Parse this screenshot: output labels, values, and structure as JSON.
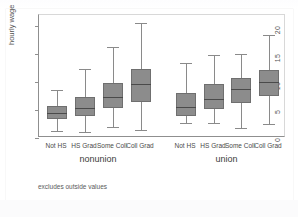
{
  "figure": {
    "footnote": "excludes outside values",
    "box_fill_color": "#8c8c8c",
    "box_edge_color": "#6f6f6f",
    "whisker_color": "#8a8a8a",
    "median_color": "#4a4a4a",
    "axis_color": "#8f8f8f",
    "background_color": "#ffffff"
  },
  "chart_data": {
    "type": "box",
    "title": "",
    "xlabel": "",
    "ylabel": "hourly wage",
    "ylim": [
      0,
      22
    ],
    "yticks": [
      0,
      5,
      10,
      15,
      20
    ],
    "ytick_labels": [
      "0",
      "5",
      "10",
      "15",
      "20"
    ],
    "grid": false,
    "legend": "none",
    "note": "excludes outside values",
    "group_labels": [
      "nonunion",
      "union"
    ],
    "categories": [
      "Not HS",
      "HS Grad",
      "Some Coll",
      "Coll Grad"
    ],
    "groups": [
      {
        "name": "nonunion",
        "boxes": [
          {
            "category": "Not HS",
            "whisker_low": 1.2,
            "q1": 3.4,
            "median": 4.4,
            "q3": 5.7,
            "whisker_high": 8.6
          },
          {
            "category": "HS Grad",
            "whisker_low": 1.1,
            "q1": 4.0,
            "median": 5.4,
            "q3": 7.3,
            "whisker_high": 12.4
          },
          {
            "category": "Some Coll",
            "whisker_low": 1.9,
            "q1": 5.3,
            "median": 7.4,
            "q3": 9.8,
            "whisker_high": 16.2
          },
          {
            "category": "Coll Grad",
            "whisker_low": 1.4,
            "q1": 6.5,
            "median": 9.7,
            "q3": 12.4,
            "whisker_high": 20.6
          }
        ]
      },
      {
        "name": "union",
        "boxes": [
          {
            "category": "Not HS",
            "whisker_low": 2.7,
            "q1": 4.0,
            "median": 5.5,
            "q3": 8.0,
            "whisker_high": 13.5
          },
          {
            "category": "HS Grad",
            "whisker_low": 2.6,
            "q1": 5.2,
            "median": 7.0,
            "q3": 9.6,
            "whisker_high": 14.8
          },
          {
            "category": "Some Coll",
            "whisker_low": 1.7,
            "q1": 6.2,
            "median": 8.7,
            "q3": 10.8,
            "whisker_high": 15.1
          },
          {
            "category": "Coll Grad",
            "whisker_low": 2.5,
            "q1": 7.6,
            "median": 10.0,
            "q3": 12.1,
            "whisker_high": 18.4
          }
        ]
      }
    ]
  }
}
